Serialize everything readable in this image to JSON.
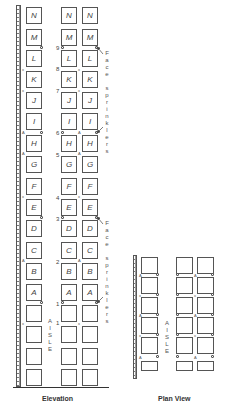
{
  "elevation": {
    "caption": "Elevation",
    "aisle_label": "A\nI\nS\nL\nE",
    "rows": [
      "N",
      "M",
      "L",
      "K",
      "J",
      "I",
      "H",
      "G",
      "F",
      "E",
      "D",
      "C",
      "B",
      "A",
      "",
      "",
      "",
      ""
    ],
    "level_numbers": [
      "9",
      "8",
      "7",
      "6",
      "5",
      "4",
      "3",
      "2",
      "1",
      "1"
    ],
    "annotations": {
      "upper": "F\na\nc\ne\n\ns\np\nr\ni\nn\nk\nl\ne\nr\ns",
      "lower": "F\na\nc\ne\n\ns\np\nr\ni\nn\nk\nl\ne\nr\ns"
    },
    "symbols": {
      "flue": "x",
      "in_rack": "A",
      "face": "o"
    }
  },
  "plan": {
    "caption": "Plan View",
    "aisle_label": "A\nI\nS\nL\nE"
  },
  "colors": {
    "line": "#555555",
    "background": "#ffffff",
    "text": "#333333"
  }
}
